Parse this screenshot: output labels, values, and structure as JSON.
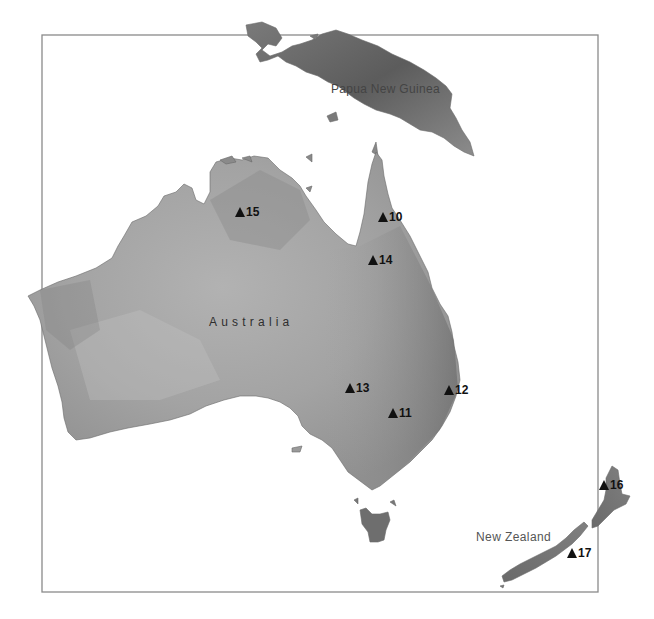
{
  "map": {
    "colors": {
      "background": "#ffffff",
      "frame": "#8a8a8a",
      "land_light": "#b4b4b4",
      "land_mid": "#9a9a9a",
      "land_dark": "#6e6e6e",
      "marker": "#111111"
    },
    "frame": {
      "x": 42,
      "y": 35,
      "width": 556,
      "height": 557
    },
    "regions": [
      {
        "id": "papua-new-guinea",
        "label": "Papua New Guinea"
      },
      {
        "id": "australia",
        "label": "Australia"
      },
      {
        "id": "new-zealand",
        "label": "New Zealand"
      }
    ],
    "markers": [
      {
        "id": "10",
        "label": "10",
        "x": 378,
        "y": 210
      },
      {
        "id": "11",
        "label": "11",
        "x": 388,
        "y": 406
      },
      {
        "id": "12",
        "label": "12",
        "x": 444,
        "y": 383
      },
      {
        "id": "13",
        "label": "13",
        "x": 345,
        "y": 381
      },
      {
        "id": "14",
        "label": "14",
        "x": 368,
        "y": 253
      },
      {
        "id": "15",
        "label": "15",
        "x": 235,
        "y": 205
      },
      {
        "id": "16",
        "label": "16",
        "x": 599,
        "y": 478
      },
      {
        "id": "17",
        "label": "17",
        "x": 567,
        "y": 546
      }
    ],
    "marker_icon": "triangle-up-icon"
  }
}
